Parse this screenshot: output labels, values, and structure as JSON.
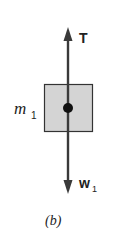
{
  "figure": {
    "caption": "(b)",
    "block": {
      "label": "m",
      "label_subscript": "1",
      "fill_color": "#d4d4d4",
      "border_color": "#333333"
    },
    "forces": [
      {
        "label": "T",
        "label_subscript": "",
        "direction": "up"
      },
      {
        "label": "w",
        "label_subscript": "1",
        "direction": "down"
      }
    ],
    "line_color": "#3a3a3a"
  }
}
